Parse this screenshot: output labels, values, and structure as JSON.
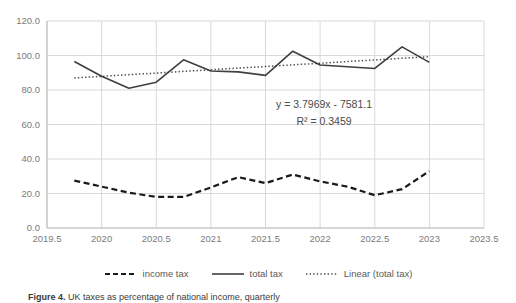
{
  "figure": {
    "caption_label": "Figure 4.",
    "caption_text": "UK taxes as percentage of national income, quarterly"
  },
  "annotation": {
    "equation": "y = 3.7969x - 7581.1",
    "r_squared": "R² = 0.3459"
  },
  "legend": {
    "items": [
      {
        "label": "income tax",
        "style": "dashed",
        "color": "#1a1a1a"
      },
      {
        "label": "total tax",
        "style": "solid",
        "color": "#3f3f3f"
      },
      {
        "label": "Linear (total tax)",
        "style": "dotted",
        "color": "#4a4a4a"
      }
    ]
  },
  "axes": {
    "yticks": [
      "0.0",
      "20.0",
      "40.0",
      "60.0",
      "80.0",
      "100.0",
      "120.0"
    ],
    "xticks": [
      "2019.5",
      "2020",
      "2020.5",
      "2021",
      "2021.5",
      "2022",
      "2022.5",
      "2023",
      "2023.5"
    ]
  },
  "colors": {
    "gridline": "#d9d9d9",
    "axisline": "#bfbfbf",
    "income_tax": "#1a1a1a",
    "total_tax": "#3f3f3f",
    "trendline": "#4a4a4a",
    "tick_label": "#7b7b7b"
  },
  "chart_data": {
    "type": "line",
    "title": "UK taxes as percentage of national income, quarterly",
    "xlabel": "",
    "ylabel": "",
    "xlim": [
      2019.5,
      2023.5
    ],
    "ylim": [
      0.0,
      120.0
    ],
    "ytick_step": 20.0,
    "xtick_step": 0.5,
    "grid": "both",
    "legend_position": "bottom",
    "annotations": [
      "y = 3.7969x - 7581.1",
      "R² = 0.3459"
    ],
    "x": [
      2019.75,
      2020.0,
      2020.25,
      2020.5,
      2020.75,
      2021.0,
      2021.25,
      2021.5,
      2021.75,
      2022.0,
      2022.25,
      2022.5,
      2022.75,
      2023.0
    ],
    "series": [
      {
        "name": "total tax",
        "style": "solid",
        "values": [
          96.5,
          88.0,
          81.0,
          84.5,
          97.5,
          91.0,
          90.5,
          88.5,
          102.5,
          94.5,
          93.5,
          92.5,
          105.0,
          96.0
        ]
      },
      {
        "name": "income tax",
        "style": "dashed",
        "values": [
          27.5,
          24.0,
          20.5,
          18.0,
          18.0,
          23.5,
          29.5,
          26.0,
          31.0,
          27.0,
          24.0,
          19.0,
          22.5,
          33.0
        ]
      },
      {
        "name": "Linear (total tax)",
        "style": "dotted",
        "trendline_for": "total tax",
        "slope": 3.7969,
        "intercept": -7581.1,
        "r_squared": 0.3459,
        "values": [
          87.0,
          87.9,
          88.9,
          89.8,
          90.8,
          91.7,
          92.7,
          93.6,
          94.6,
          95.5,
          96.5,
          97.4,
          98.4,
          99.3
        ]
      }
    ]
  }
}
